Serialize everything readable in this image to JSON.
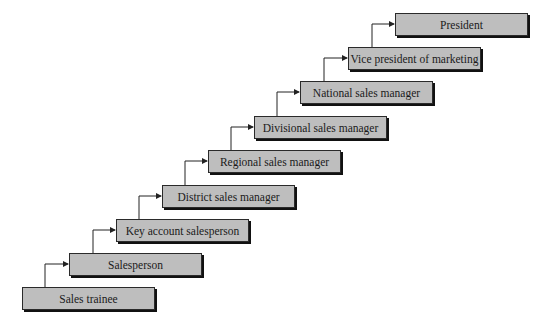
{
  "diagram": {
    "type": "career-ladder",
    "direction": "bottom-left to top-right",
    "box_fill": "#bebebe",
    "box_border": "#2a2a2a",
    "connector_color": "#222222",
    "steps": [
      {
        "label": "Sales trainee",
        "x": 22,
        "y": 287
      },
      {
        "label": "Salesperson",
        "x": 69,
        "y": 253
      },
      {
        "label": "Key account salesperson",
        "x": 116,
        "y": 219
      },
      {
        "label": "District sales manager",
        "x": 162,
        "y": 185
      },
      {
        "label": "Regional sales manager",
        "x": 208,
        "y": 150
      },
      {
        "label": "Divisional sales manager",
        "x": 254,
        "y": 116
      },
      {
        "label": "National sales manager",
        "x": 300,
        "y": 81
      },
      {
        "label": "Vice president of marketing",
        "x": 348,
        "y": 47
      },
      {
        "label": "President",
        "x": 395,
        "y": 13
      }
    ]
  }
}
